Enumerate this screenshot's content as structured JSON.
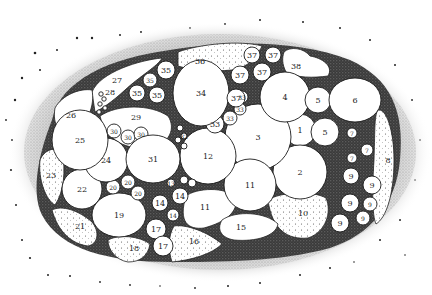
{
  "diagram": {
    "type": "stippled anatomical cross-section with numbered compartments",
    "colors": {
      "background": "#ffffff",
      "ink": "#1a1a1a",
      "stipple_dark": "#2b2b2b",
      "stipple_mid": "#6a6a6a",
      "compartment_fill": "#ffffff"
    },
    "labels": [
      {
        "id": "1",
        "x": 300,
        "y": 130,
        "r": 16
      },
      {
        "id": "2",
        "x": 300,
        "y": 172,
        "r": 27
      },
      {
        "id": "3",
        "x": 258,
        "y": 137,
        "r": 33
      },
      {
        "id": "4",
        "x": 285,
        "y": 97,
        "r": 25
      },
      {
        "id": "5",
        "x": 318,
        "y": 100,
        "r": 13
      },
      {
        "id": "5",
        "x": 325,
        "y": 132,
        "r": 14
      },
      {
        "id": "6",
        "x": 355,
        "y": 100,
        "r": 25
      },
      {
        "id": "7",
        "x": 352,
        "y": 133,
        "r": 5
      },
      {
        "id": "7",
        "x": 367,
        "y": 150,
        "r": 6
      },
      {
        "id": "7",
        "x": 352,
        "y": 158,
        "r": 5
      },
      {
        "id": "8",
        "x": 388,
        "y": 160,
        "r": 0
      },
      {
        "id": "9",
        "x": 351,
        "y": 176,
        "r": 8
      },
      {
        "id": "9",
        "x": 372,
        "y": 185,
        "r": 9
      },
      {
        "id": "9",
        "x": 350,
        "y": 203,
        "r": 9
      },
      {
        "id": "9",
        "x": 370,
        "y": 204,
        "r": 7
      },
      {
        "id": "9",
        "x": 340,
        "y": 223,
        "r": 9
      },
      {
        "id": "9",
        "x": 363,
        "y": 218,
        "r": 7
      },
      {
        "id": "10",
        "x": 303,
        "y": 213,
        "r": 0
      },
      {
        "id": "11",
        "x": 250,
        "y": 185,
        "r": 26
      },
      {
        "id": "11",
        "x": 205,
        "y": 207,
        "r": 0
      },
      {
        "id": "12",
        "x": 208,
        "y": 156,
        "r": 28
      },
      {
        "id": "13",
        "x": 171,
        "y": 183,
        "r": 4
      },
      {
        "id": "14",
        "x": 160,
        "y": 203,
        "r": 8
      },
      {
        "id": "14",
        "x": 180,
        "y": 196,
        "r": 8
      },
      {
        "id": "14",
        "x": 173,
        "y": 215,
        "r": 6
      },
      {
        "id": "15",
        "x": 241,
        "y": 227,
        "r": 0
      },
      {
        "id": "16",
        "x": 194,
        "y": 241,
        "r": 0
      },
      {
        "id": "17",
        "x": 156,
        "y": 229,
        "r": 10
      },
      {
        "id": "17",
        "x": 163,
        "y": 246,
        "r": 10
      },
      {
        "id": "18",
        "x": 134,
        "y": 248,
        "r": 0
      },
      {
        "id": "19",
        "x": 119,
        "y": 215,
        "r": 27
      },
      {
        "id": "20",
        "x": 113,
        "y": 187,
        "r": 7
      },
      {
        "id": "20",
        "x": 128,
        "y": 182,
        "r": 7
      },
      {
        "id": "20",
        "x": 138,
        "y": 193,
        "r": 7
      },
      {
        "id": "21",
        "x": 80,
        "y": 226,
        "r": 0
      },
      {
        "id": "22",
        "x": 82,
        "y": 189,
        "r": 20
      },
      {
        "id": "23",
        "x": 51,
        "y": 175,
        "r": 0
      },
      {
        "id": "24",
        "x": 106,
        "y": 160,
        "r": 22
      },
      {
        "id": "25",
        "x": 80,
        "y": 140,
        "r": 28
      },
      {
        "id": "26",
        "x": 71,
        "y": 115,
        "r": 0
      },
      {
        "id": "27",
        "x": 117,
        "y": 80,
        "r": 0
      },
      {
        "id": "28",
        "x": 110,
        "y": 92,
        "r": 0
      },
      {
        "id": "29",
        "x": 136,
        "y": 117,
        "r": 0
      },
      {
        "id": "30",
        "x": 114,
        "y": 131,
        "r": 7
      },
      {
        "id": "30",
        "x": 128,
        "y": 137,
        "r": 7
      },
      {
        "id": "30",
        "x": 141,
        "y": 134,
        "r": 7
      },
      {
        "id": "31",
        "x": 153,
        "y": 159,
        "r": 25
      },
      {
        "id": "32",
        "x": 184,
        "y": 136,
        "r": 4
      },
      {
        "id": "33",
        "x": 215,
        "y": 124,
        "r": 9
      },
      {
        "id": "33",
        "x": 230,
        "y": 118,
        "r": 7
      },
      {
        "id": "33",
        "x": 240,
        "y": 109,
        "r": 6
      },
      {
        "id": "33",
        "x": 242,
        "y": 97,
        "r": 6
      },
      {
        "id": "34",
        "x": 201,
        "y": 93,
        "r": 33
      },
      {
        "id": "35",
        "x": 166,
        "y": 70,
        "r": 9
      },
      {
        "id": "35",
        "x": 150,
        "y": 80,
        "r": 7
      },
      {
        "id": "35",
        "x": 137,
        "y": 93,
        "r": 8
      },
      {
        "id": "35",
        "x": 157,
        "y": 95,
        "r": 8
      },
      {
        "id": "36",
        "x": 200,
        "y": 61,
        "r": 0
      },
      {
        "id": "37",
        "x": 252,
        "y": 55,
        "r": 8
      },
      {
        "id": "37",
        "x": 273,
        "y": 55,
        "r": 8
      },
      {
        "id": "37",
        "x": 240,
        "y": 75,
        "r": 9
      },
      {
        "id": "37",
        "x": 262,
        "y": 72,
        "r": 9
      },
      {
        "id": "37",
        "x": 236,
        "y": 98,
        "r": 9
      },
      {
        "id": "38",
        "x": 296,
        "y": 66,
        "r": 0
      }
    ]
  }
}
